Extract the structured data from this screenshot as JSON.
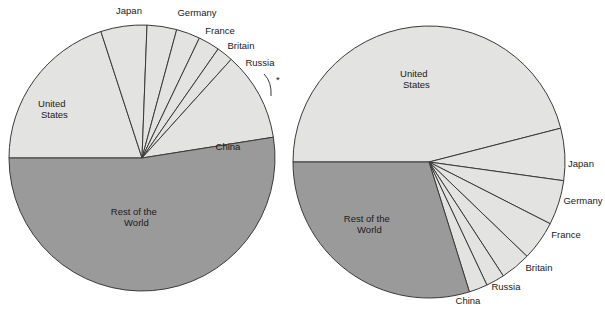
{
  "figure": {
    "title": "",
    "background": "#ffffff",
    "colors": {
      "light_slice": "#e3e3e1",
      "dark_slice": "#9a9a9a",
      "outline": "#3a3a3a",
      "text": "#1a1a1a"
    }
  },
  "chart_data": {
    "type": "pie",
    "title": "",
    "count": 2,
    "charts": [
      {
        "id": "left-pie",
        "title": "",
        "center": {
          "x": 142,
          "y": 158
        },
        "radius": 133,
        "start_angle_deg": 180,
        "direction": "clockwise",
        "categories": [
          "United States",
          "Japan",
          "Germany",
          "France",
          "Britain",
          "Russia",
          "China",
          "Rest of the World"
        ],
        "values": [
          20.0,
          5.6,
          3.6,
          2.9,
          2.6,
          2.0,
          10.8,
          52.5
        ],
        "unit": "percent",
        "labels": [
          {
            "name": "United States",
            "text": "United\nStates",
            "placement": "inside",
            "x": 61,
            "y": 107
          },
          {
            "name": "Japan",
            "text": "Japan",
            "placement": "outside",
            "x": 129,
            "y": 13
          },
          {
            "name": "Germany",
            "text": "Germany",
            "placement": "outside",
            "x": 197,
            "y": 15
          },
          {
            "name": "France",
            "text": "France",
            "placement": "outside",
            "x": 220,
            "y": 33
          },
          {
            "name": "Britain",
            "text": "Britain",
            "placement": "outside",
            "x": 240,
            "y": 47
          },
          {
            "name": "Russia",
            "text": "Russia",
            "placement": "outside",
            "x": 259,
            "y": 64
          },
          {
            "name": "China",
            "text": "China",
            "placement": "inside",
            "x": 228,
            "y": 146
          },
          {
            "name": "Rest of the World",
            "text": "Rest of the\nWorld",
            "placement": "inside",
            "x": 143,
            "y": 216
          }
        ]
      },
      {
        "id": "right-pie",
        "title": "",
        "center": {
          "x": 429,
          "y": 162
        },
        "radius": 136,
        "start_angle_deg": 180,
        "direction": "clockwise",
        "categories": [
          "United States",
          "Japan",
          "Germany",
          "France",
          "Britain",
          "Russia",
          "China",
          "Rest of the World"
        ],
        "values": [
          46.0,
          6.2,
          5.3,
          4.7,
          3.6,
          2.2,
          2.2,
          29.8
        ],
        "unit": "percent",
        "labels": [
          {
            "name": "United States",
            "text": "United\nStates",
            "placement": "inside",
            "x": 423,
            "y": 80
          },
          {
            "name": "Japan",
            "text": "Japan",
            "placement": "outside",
            "x": 580,
            "y": 164
          },
          {
            "name": "Germany",
            "text": "Germany",
            "placement": "outside",
            "x": 585,
            "y": 203
          },
          {
            "name": "France",
            "text": "France",
            "placement": "outside",
            "x": 566,
            "y": 236
          },
          {
            "name": "Britain",
            "text": "Britain",
            "placement": "outside",
            "x": 540,
            "y": 270
          },
          {
            "name": "Russia",
            "text": "Russia",
            "placement": "outside",
            "x": 507,
            "y": 288
          },
          {
            "name": "China",
            "text": "China",
            "placement": "outside",
            "x": 468,
            "y": 302
          },
          {
            "name": "Rest of the World",
            "text": "Rest of the\nWorld",
            "placement": "inside",
            "x": 376,
            "y": 223
          }
        ]
      }
    ],
    "legend": "none",
    "grid": false
  },
  "labels": {
    "left": {
      "united_states_1": "United",
      "united_states_2": "States",
      "japan": "Japan",
      "germany": "Germany",
      "france": "France",
      "britain": "Britain",
      "russia": "Russia",
      "china": "China",
      "rest_1": "Rest of the",
      "rest_2": "World"
    },
    "right": {
      "united_states_1": "United",
      "united_states_2": "States",
      "japan": "Japan",
      "germany": "Germany",
      "france": "France",
      "britain": "Britain",
      "russia": "Russia",
      "china": "China",
      "rest_1": "Rest of the",
      "rest_2": "World"
    }
  }
}
